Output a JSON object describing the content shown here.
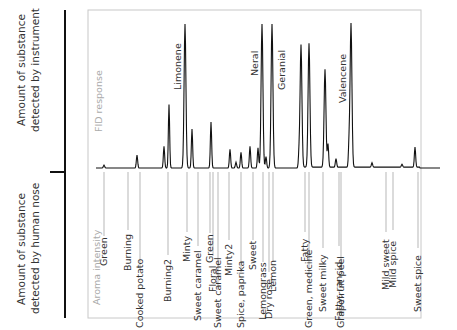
{
  "side_labels": {
    "instrument": [
      "Amount of substance",
      "detected by instrument"
    ],
    "nose": [
      "Amount of substance",
      "detected by human nose"
    ]
  },
  "upper_panel": {
    "axis_title": "FID response",
    "peak_labels": [
      "Limonene",
      "Neral",
      "Geranial",
      "Valencene"
    ]
  },
  "lower_panel": {
    "axis_title": "Aroma intensity"
  },
  "chart_data": {
    "type": "line",
    "title": "",
    "upper": {
      "ylabel": "FID response",
      "peaks": [
        {
          "x": 104,
          "height": 0.02,
          "label": ""
        },
        {
          "x": 137,
          "height": 0.09,
          "label": ""
        },
        {
          "x": 164,
          "height": 0.15,
          "label": ""
        },
        {
          "x": 169,
          "height": 0.44,
          "label": ""
        },
        {
          "x": 185,
          "height": 1.0,
          "label": "Limonene"
        },
        {
          "x": 192,
          "height": 0.27,
          "label": ""
        },
        {
          "x": 211,
          "height": 0.32,
          "label": ""
        },
        {
          "x": 230,
          "height": 0.13,
          "label": ""
        },
        {
          "x": 236,
          "height": 0.04,
          "label": ""
        },
        {
          "x": 241,
          "height": 0.11,
          "label": ""
        },
        {
          "x": 250,
          "height": 0.15,
          "label": ""
        },
        {
          "x": 258,
          "height": 0.14,
          "label": ""
        },
        {
          "x": 262,
          "height": 1.0,
          "label": "Neral"
        },
        {
          "x": 266,
          "height": 0.08,
          "label": ""
        },
        {
          "x": 272,
          "height": 1.0,
          "label": "Geranial"
        },
        {
          "x": 299,
          "height": 0.09,
          "label": ""
        },
        {
          "x": 301,
          "height": 0.85,
          "label": ""
        },
        {
          "x": 309,
          "height": 0.86,
          "label": ""
        },
        {
          "x": 325,
          "height": 0.68,
          "label": ""
        },
        {
          "x": 328,
          "height": 0.16,
          "label": ""
        },
        {
          "x": 336,
          "height": 0.06,
          "label": ""
        },
        {
          "x": 349,
          "height": 0.14,
          "label": ""
        },
        {
          "x": 351,
          "height": 1.0,
          "label": "Valencene"
        },
        {
          "x": 372,
          "height": 0.03,
          "label": ""
        },
        {
          "x": 402,
          "height": 0.02,
          "label": ""
        },
        {
          "x": 415,
          "height": 0.14,
          "label": ""
        }
      ]
    },
    "lower": {
      "ylabel": "Aroma intensity",
      "descriptors": [
        {
          "x": 104,
          "label": "Green"
        },
        {
          "x": 128,
          "label": "Burning"
        },
        {
          "x": 140,
          "label": "Cooked potato"
        },
        {
          "x": 168,
          "label": "Burning2"
        },
        {
          "x": 187,
          "label": "Minty"
        },
        {
          "x": 198,
          "label": "Sweet caramel"
        },
        {
          "x": 210,
          "label": "Green"
        },
        {
          "x": 213,
          "label": "Floral"
        },
        {
          "x": 218,
          "label": "Sweet caramel"
        },
        {
          "x": 229,
          "label": "Minty2"
        },
        {
          "x": 241,
          "label": "Spice, paprika"
        },
        {
          "x": 253,
          "label": "Sweet"
        },
        {
          "x": 263,
          "label": "Lemongrass"
        },
        {
          "x": 269,
          "label": "Dry rose"
        },
        {
          "x": 273,
          "label": "Lemon"
        },
        {
          "x": 305,
          "label": "Fatty"
        },
        {
          "x": 309,
          "label": "Green, medicine"
        },
        {
          "x": 323,
          "label": "Sweet milky"
        },
        {
          "x": 339,
          "label": "Fatty, rancid"
        },
        {
          "x": 341,
          "label": "Grapefruit peel"
        },
        {
          "x": 386,
          "label": "Mild sweet"
        },
        {
          "x": 393,
          "label": "Mild spice"
        },
        {
          "x": 418,
          "label": "Sweet spice"
        }
      ]
    },
    "grid": false,
    "legend": null
  }
}
